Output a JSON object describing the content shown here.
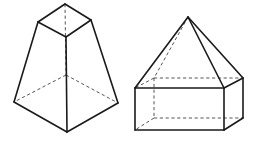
{
  "canvas": {
    "width": 257,
    "height": 143,
    "background": "#ffffff",
    "title": "Two geometric solids line drawing"
  },
  "style": {
    "visible_edge_color": "#1a1a1a",
    "hidden_edge_color": "#555555",
    "face_color": "#ffffff",
    "visible_edge_width": 1.6,
    "hidden_edge_width": 1.0,
    "hidden_dash_pattern": "3.2 2.6"
  },
  "figures": [
    {
      "id": "figure-left",
      "name": "square-frustum",
      "label": "Frustum of a square pyramid",
      "description": "A truncated square pyramid drawn in oblique view with a small square top face and a large square base; hidden rear edges are dashed.",
      "vertices": {
        "top_back": [
          65,
          4
        ],
        "top_left": [
          38,
          22
        ],
        "top_right": [
          91,
          20
        ],
        "top_front": [
          66,
          37
        ],
        "base_back": [
          66,
          75
        ],
        "base_left": [
          14,
          102
        ],
        "base_right": [
          118,
          103
        ],
        "base_front": [
          67,
          132
        ]
      },
      "visible_edges": [
        [
          "top_back",
          "top_left"
        ],
        [
          "top_back",
          "top_right"
        ],
        [
          "top_left",
          "top_front"
        ],
        [
          "top_right",
          "top_front"
        ],
        [
          "top_left",
          "base_left"
        ],
        [
          "top_right",
          "base_right"
        ],
        [
          "top_front",
          "base_front"
        ],
        [
          "base_left",
          "base_front"
        ],
        [
          "base_right",
          "base_front"
        ]
      ],
      "hidden_edges": [
        [
          "top_back",
          "base_back"
        ],
        [
          "base_back",
          "base_left"
        ],
        [
          "base_back",
          "base_right"
        ]
      ]
    },
    {
      "id": "figure-right",
      "name": "pyramid-on-prism",
      "label": "Square pyramid on a rectangular prism",
      "description": "A house-like composite solid: a tall square pyramid sitting on top of a rectangular box, drawn in oblique view with dashed hidden edges.",
      "vertices": {
        "apex": [
          188,
          17
        ],
        "top_front_left": [
          135,
          88
        ],
        "top_front_right": [
          224,
          88
        ],
        "top_back_right": [
          243,
          78
        ],
        "top_back_left": [
          154,
          78
        ],
        "bottom_front_left": [
          135,
          130
        ],
        "bottom_front_right": [
          224,
          130
        ],
        "bottom_back_right": [
          243,
          118
        ],
        "bottom_back_left": [
          154,
          118
        ]
      },
      "visible_edges": [
        [
          "apex",
          "top_front_left"
        ],
        [
          "apex",
          "top_front_right"
        ],
        [
          "apex",
          "top_back_right"
        ],
        [
          "top_front_left",
          "top_front_right"
        ],
        [
          "top_front_right",
          "top_back_right"
        ],
        [
          "top_front_left",
          "bottom_front_left"
        ],
        [
          "top_front_right",
          "bottom_front_right"
        ],
        [
          "top_back_right",
          "bottom_back_right"
        ],
        [
          "bottom_front_left",
          "bottom_front_right"
        ],
        [
          "bottom_front_right",
          "bottom_back_right"
        ]
      ],
      "hidden_edges": [
        [
          "apex",
          "top_back_left"
        ],
        [
          "top_back_left",
          "top_front_left"
        ],
        [
          "top_back_left",
          "top_back_right"
        ],
        [
          "top_back_left",
          "bottom_back_left"
        ],
        [
          "bottom_back_left",
          "bottom_front_left"
        ],
        [
          "bottom_back_left",
          "bottom_back_right"
        ]
      ]
    }
  ]
}
